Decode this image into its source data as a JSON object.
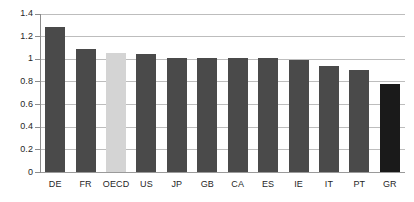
{
  "chart_data": {
    "type": "bar",
    "title": "",
    "subtitle": "",
    "xlabel": "",
    "ylabel": "",
    "categories": [
      "DE",
      "FR",
      "OECD",
      "US",
      "JP",
      "GB",
      "CA",
      "ES",
      "IE",
      "IT",
      "PT",
      "GR"
    ],
    "values": [
      1.28,
      1.09,
      1.05,
      1.04,
      1.01,
      1.01,
      1.005,
      1.005,
      0.99,
      0.94,
      0.9,
      0.78
    ],
    "bar_colors": [
      "#4a4a4a",
      "#4a4a4a",
      "#d4d4d4",
      "#4a4a4a",
      "#4a4a4a",
      "#4a4a4a",
      "#4a4a4a",
      "#4a4a4a",
      "#4a4a4a",
      "#4a4a4a",
      "#4a4a4a",
      "#1a1a1a"
    ],
    "ylim": [
      0,
      1.4
    ],
    "yticks": [
      0,
      0.2,
      0.4,
      0.6,
      0.8,
      1,
      1.2,
      1.4
    ],
    "ytick_labels": [
      "0",
      "0.2",
      "0.4",
      "0.6",
      "0.8",
      "1",
      "1.2",
      "1.4"
    ],
    "grid": true,
    "grid_axis": "y",
    "legend": false,
    "legend_position": "none",
    "annotations": []
  },
  "colors": {
    "bar_default": "#4a4a4a",
    "bar_highlight_light": "#d4d4d4",
    "bar_highlight_dark": "#1a1a1a",
    "gridline": "#bdbdbd",
    "axis": "#8c8c8c",
    "text": "#262626",
    "background": "#ffffff"
  }
}
